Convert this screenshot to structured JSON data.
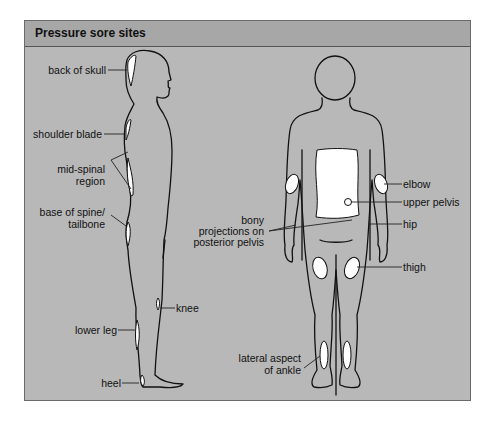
{
  "header": {
    "title": "Pressure sore sites"
  },
  "side_view": {
    "labels": [
      {
        "id": "back-of-skull",
        "text": "back of skull"
      },
      {
        "id": "shoulder-blade",
        "text": "shoulder blade"
      },
      {
        "id": "mid-spinal-region-1",
        "text": "mid-spinal"
      },
      {
        "id": "mid-spinal-region-2",
        "text": "region"
      },
      {
        "id": "base-of-spine-1",
        "text": "base of spine/"
      },
      {
        "id": "base-of-spine-2",
        "text": "tailbone"
      },
      {
        "id": "knee",
        "text": "knee"
      },
      {
        "id": "lower-leg",
        "text": "lower leg"
      },
      {
        "id": "heel",
        "text": "heel"
      }
    ]
  },
  "back_view": {
    "labels": [
      {
        "id": "elbow",
        "text": "elbow"
      },
      {
        "id": "upper-pelvis",
        "text": "upper pelvis"
      },
      {
        "id": "bony-projections-1",
        "text": "bony"
      },
      {
        "id": "bony-projections-2",
        "text": "projections on"
      },
      {
        "id": "bony-projections-3",
        "text": "posterior pelvis"
      },
      {
        "id": "hip",
        "text": "hip"
      },
      {
        "id": "thigh",
        "text": "thigh"
      },
      {
        "id": "lateral-ankle-1",
        "text": "lateral aspect"
      },
      {
        "id": "lateral-ankle-2",
        "text": "of ankle"
      }
    ]
  },
  "colors": {
    "panel": "#b8b8b8",
    "header": "#a7a7a7",
    "sore_site": "#ffffff",
    "outline": "#111111"
  }
}
